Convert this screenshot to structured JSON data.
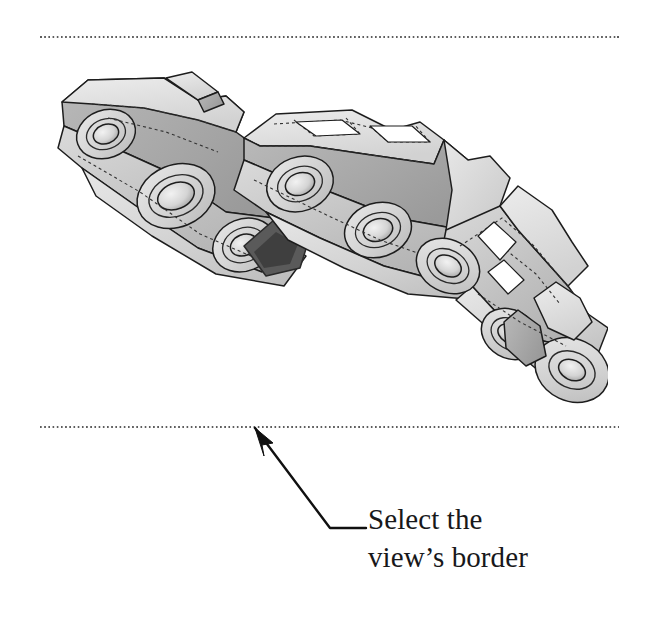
{
  "page": {
    "width": 654,
    "height": 617,
    "background_color": "#ffffff"
  },
  "view_border": {
    "name": "drawing-view-border",
    "style": "dotted",
    "dot_color": "#5d5d5d",
    "left": 40,
    "top": 36,
    "width": 579,
    "height": 392
  },
  "figure": {
    "icon_name": "chain-assembly-isometric-model",
    "shading": {
      "face_light": "#e2e2e2",
      "face_mid": "#c6c6c6",
      "face_dark": "#a8a8a8",
      "face_shadow": "#6d6d6d",
      "outline": "#1d1d1d",
      "hidden_line": "#3a3a3a"
    },
    "link_count": 7,
    "pin_hole_count": 9
  },
  "callout": {
    "leader": {
      "icon_name": "arrow-leader-line",
      "arrow_tip_x": 255,
      "arrow_tip_y": 428,
      "elbow_x": 330,
      "elbow_y": 528,
      "shoulder_end_x": 366,
      "shoulder_end_y": 528,
      "color": "#101010"
    },
    "text": {
      "line1": "Select the",
      "line2": "view’s border"
    }
  }
}
